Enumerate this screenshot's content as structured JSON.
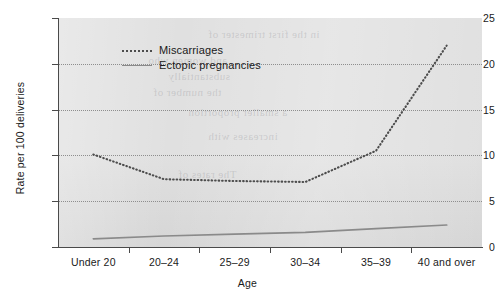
{
  "chart_data": {
    "type": "line",
    "title": "",
    "xlabel": "Age",
    "ylabel": "Rate per 100 deliveries",
    "categories": [
      "Under 20",
      "20–24",
      "25–29",
      "30–34",
      "35–39",
      "40 and over"
    ],
    "series": [
      {
        "name": "Miscarriages",
        "style": "dotted",
        "color": "#4d4d4d",
        "values": [
          10.1,
          7.4,
          7.2,
          7.1,
          10.5,
          22.0
        ]
      },
      {
        "name": "Ectopic pregnancies",
        "style": "solid",
        "color": "#8a8a8a",
        "values": [
          0.9,
          1.2,
          1.4,
          1.6,
          2.0,
          2.4
        ]
      }
    ],
    "ylim": [
      0,
      25
    ],
    "y_ticks": [
      0,
      5,
      10,
      15,
      20,
      25
    ],
    "y_tick_labels": [
      "0",
      "5",
      "10",
      "15",
      "20",
      "25"
    ],
    "grid": "horizontal-dotted",
    "legend_position": "top-left",
    "plot_background": "#e0e0e0"
  },
  "axes": {
    "y": {
      "title": "Rate per 100 deliveries",
      "labels": [
        "25",
        "20",
        "15",
        "10",
        "5",
        "0"
      ]
    },
    "x": {
      "title": "Age",
      "labels": [
        "Under 20",
        "20–24",
        "25–29",
        "30–34",
        "35–39",
        "40 and over"
      ]
    }
  },
  "legend": {
    "items": [
      {
        "label": "Miscarriages"
      },
      {
        "label": "Ectopic pregnancies"
      }
    ]
  },
  "background_bleed": {
    "lines": [
      "PREGNANCY",
      "in the first trimester of",
      "and women who",
      "substantially",
      "the number of",
      "a smaller proportion",
      "increases with",
      "The rates of"
    ]
  }
}
